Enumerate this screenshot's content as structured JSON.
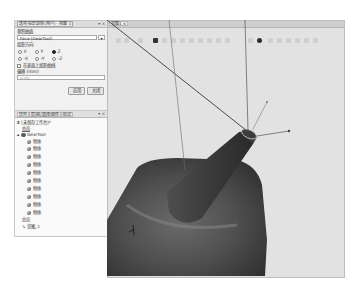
{
  "options_panel": {
    "title": "选项·投影到体(用户) - 视图 1",
    "controls": "▾ ×",
    "surface_label": "参照曲面",
    "surface_value": "Face (GearTool)",
    "direction_label": "投影方向",
    "directions": [
      {
        "label": "X",
        "selected": false
      },
      {
        "label": "Y",
        "selected": false
      },
      {
        "label": "Z",
        "selected": true
      },
      {
        "label": "-X",
        "selected": false
      },
      {
        "label": "-Y",
        "selected": false
      },
      {
        "label": "-Z",
        "selected": false
      }
    ],
    "project_checkbox_label": "在表面上投影曲线",
    "project_checkbox_checked": false,
    "offset_label": "偏移 (mm)",
    "offset_value": "0.00",
    "apply_label": "应用",
    "close_label": "关闭"
  },
  "structure_panel": {
    "tabs": [
      "结构",
      "层/组/选择/组件",
      "标记"
    ],
    "controls": "▾ ×",
    "root": "[未保存工作台]*",
    "group1": "曲面",
    "component": "GearTool",
    "bodies": [
      "物体",
      "物体",
      "物体",
      "物体",
      "物体",
      "物体",
      "物体",
      "物体",
      "物体",
      "物体"
    ],
    "group2": "曲面",
    "sketch": "草图_1"
  },
  "viewport": {
    "tab_label": "视图1",
    "tab_close": "×",
    "background": "#e2e2e2",
    "model_color": "#4a4a4a"
  }
}
